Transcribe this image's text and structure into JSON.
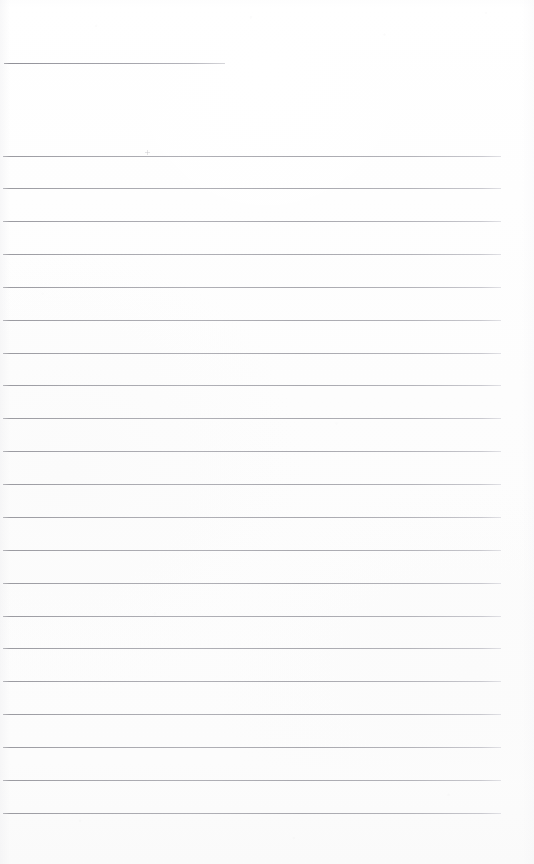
{
  "page": {
    "kind": "scanned-lined-notebook-page",
    "width": 534,
    "height": 864,
    "paper_color": "#fdfdfd",
    "background_color": "#ffffff",
    "visible_text": "",
    "text_content_note": "No text, labels, numbers or handwriting are present on this page — it is a blank ruled sheet."
  },
  "rules": {
    "line_color": "#a9a9af",
    "line_color_light": "#c8c8ce",
    "line_thickness_px": 1,
    "heading_rule": {
      "id": "heading-rule",
      "y": 63,
      "x_start": 4,
      "x_end": 225,
      "width": 221,
      "color": "#9a9aa1"
    },
    "body_rule_metrics": {
      "count": 21,
      "x_start": 3,
      "x_end": 501,
      "width": 498,
      "first_y": 156,
      "last_y": 813,
      "spacing_px": 32.85
    },
    "body_rules": [
      {
        "index": 1,
        "y": 156
      },
      {
        "index": 2,
        "y": 188
      },
      {
        "index": 3,
        "y": 221
      },
      {
        "index": 4,
        "y": 254
      },
      {
        "index": 5,
        "y": 287
      },
      {
        "index": 6,
        "y": 320
      },
      {
        "index": 7,
        "y": 353
      },
      {
        "index": 8,
        "y": 385
      },
      {
        "index": 9,
        "y": 418
      },
      {
        "index": 10,
        "y": 451
      },
      {
        "index": 11,
        "y": 484
      },
      {
        "index": 12,
        "y": 517
      },
      {
        "index": 13,
        "y": 550
      },
      {
        "index": 14,
        "y": 583
      },
      {
        "index": 15,
        "y": 616
      },
      {
        "index": 16,
        "y": 648
      },
      {
        "index": 17,
        "y": 681
      },
      {
        "index": 18,
        "y": 714
      },
      {
        "index": 19,
        "y": 747
      },
      {
        "index": 20,
        "y": 780
      },
      {
        "index": 21,
        "y": 813
      }
    ]
  },
  "artifacts": {
    "speck": {
      "x": 145,
      "y": 150,
      "size": 5
    }
  }
}
